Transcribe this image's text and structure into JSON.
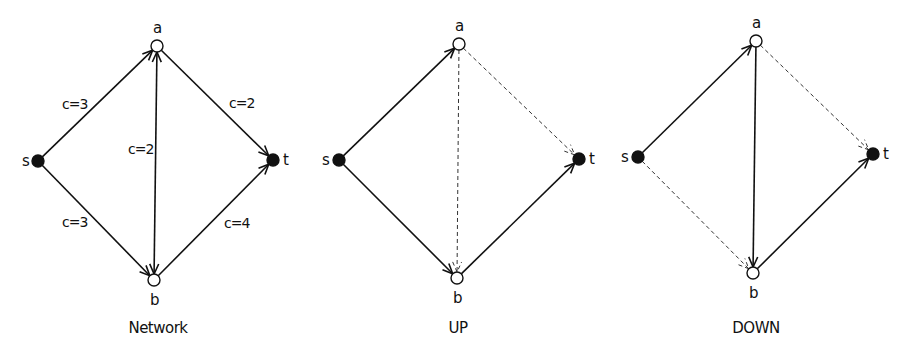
{
  "colors": {
    "stroke": "#111111",
    "dashed": "#333333",
    "terminal_fill": "#111111",
    "inner_fill": "#ffffff",
    "background": "#ffffff"
  },
  "panels": [
    {
      "id": "network",
      "caption": "Network",
      "caption_pos": [
        158,
        333
      ],
      "nodes": {
        "s": {
          "label": "s",
          "x": 38,
          "y": 161,
          "type": "terminal",
          "label_dx": -16,
          "label_dy": 5
        },
        "a": {
          "label": "a",
          "x": 157,
          "y": 46,
          "type": "inner",
          "label_dx": -4,
          "label_dy": -13
        },
        "b": {
          "label": "b",
          "x": 154,
          "y": 280,
          "type": "inner",
          "label_dx": -4,
          "label_dy": 25
        },
        "t": {
          "label": "t",
          "x": 273,
          "y": 160,
          "type": "terminal",
          "label_dx": 10,
          "label_dy": 5
        }
      },
      "edges": [
        {
          "from": "s",
          "to": "a",
          "style": "solid",
          "arrow_end": true,
          "arrow_start": false,
          "label": "c=3",
          "label_pos": [
            62,
            109
          ]
        },
        {
          "from": "s",
          "to": "b",
          "style": "solid",
          "arrow_end": true,
          "arrow_start": false,
          "label": "c=3",
          "label_pos": [
            62,
            227
          ]
        },
        {
          "from": "a",
          "to": "t",
          "style": "solid",
          "arrow_end": true,
          "arrow_start": false,
          "label": "c=2",
          "label_pos": [
            229,
            108
          ]
        },
        {
          "from": "b",
          "to": "t",
          "style": "solid",
          "arrow_end": true,
          "arrow_start": false,
          "label": "c=4",
          "label_pos": [
            224,
            228
          ]
        },
        {
          "from": "a",
          "to": "b",
          "style": "solid",
          "arrow_end": true,
          "arrow_start": true,
          "label": "c=2",
          "label_pos": [
            128,
            154
          ]
        }
      ]
    },
    {
      "id": "up",
      "caption": "UP",
      "caption_pos": [
        458,
        333
      ],
      "nodes": {
        "s": {
          "label": "s",
          "x": 339,
          "y": 160,
          "type": "terminal",
          "label_dx": -17,
          "label_dy": 5
        },
        "a": {
          "label": "a",
          "x": 459,
          "y": 44,
          "type": "inner",
          "label_dx": -4,
          "label_dy": -13
        },
        "b": {
          "label": "b",
          "x": 457,
          "y": 278,
          "type": "inner",
          "label_dx": -4,
          "label_dy": 25
        },
        "t": {
          "label": "t",
          "x": 579,
          "y": 159,
          "type": "terminal",
          "label_dx": 10,
          "label_dy": 5
        }
      },
      "edges": [
        {
          "from": "s",
          "to": "a",
          "style": "solid",
          "arrow_end": true,
          "arrow_start": false,
          "label": "",
          "label_pos": [
            0,
            0
          ]
        },
        {
          "from": "s",
          "to": "b",
          "style": "solid",
          "arrow_end": true,
          "arrow_start": false,
          "label": "",
          "label_pos": [
            0,
            0
          ]
        },
        {
          "from": "b",
          "to": "t",
          "style": "solid",
          "arrow_end": true,
          "arrow_start": false,
          "label": "",
          "label_pos": [
            0,
            0
          ]
        },
        {
          "from": "a",
          "to": "t",
          "style": "dashed",
          "arrow_end": true,
          "arrow_start": false,
          "label": "",
          "label_pos": [
            0,
            0
          ]
        },
        {
          "from": "a",
          "to": "b",
          "style": "dashed",
          "arrow_end": true,
          "arrow_start": false,
          "label": "",
          "label_pos": [
            0,
            0
          ]
        }
      ]
    },
    {
      "id": "down",
      "caption": "DOWN",
      "caption_pos": [
        756,
        333
      ],
      "nodes": {
        "s": {
          "label": "s",
          "x": 638,
          "y": 157,
          "type": "terminal",
          "label_dx": -17,
          "label_dy": 5
        },
        "a": {
          "label": "a",
          "x": 756,
          "y": 41,
          "type": "inner",
          "label_dx": -4,
          "label_dy": -13
        },
        "b": {
          "label": "b",
          "x": 753,
          "y": 273,
          "type": "inner",
          "label_dx": -4,
          "label_dy": 25
        },
        "t": {
          "label": "t",
          "x": 873,
          "y": 154,
          "type": "terminal",
          "label_dx": 10,
          "label_dy": 5
        }
      },
      "edges": [
        {
          "from": "s",
          "to": "a",
          "style": "solid",
          "arrow_end": true,
          "arrow_start": false,
          "label": "",
          "label_pos": [
            0,
            0
          ]
        },
        {
          "from": "a",
          "to": "b",
          "style": "solid",
          "arrow_end": true,
          "arrow_start": false,
          "label": "",
          "label_pos": [
            0,
            0
          ]
        },
        {
          "from": "b",
          "to": "t",
          "style": "solid",
          "arrow_end": true,
          "arrow_start": false,
          "label": "",
          "label_pos": [
            0,
            0
          ]
        },
        {
          "from": "s",
          "to": "b",
          "style": "dashed",
          "arrow_end": true,
          "arrow_start": false,
          "label": "",
          "label_pos": [
            0,
            0
          ]
        },
        {
          "from": "a",
          "to": "t",
          "style": "dashed",
          "arrow_end": true,
          "arrow_start": false,
          "label": "",
          "label_pos": [
            0,
            0
          ]
        }
      ]
    }
  ]
}
